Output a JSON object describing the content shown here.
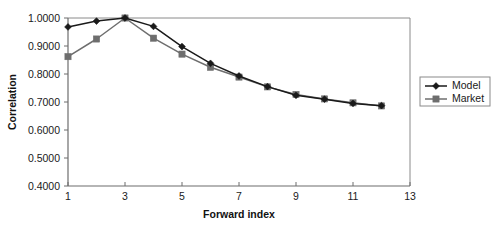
{
  "chart_data": {
    "type": "line",
    "title": "",
    "xlabel": "Forward index",
    "ylabel": "Correlation",
    "x": [
      1,
      2,
      3,
      4,
      5,
      6,
      7,
      8,
      9,
      10,
      11,
      12
    ],
    "series": [
      {
        "name": "Model",
        "marker": "diamond",
        "color": "#1a1a1a",
        "values": [
          0.968,
          0.989,
          1.0,
          0.97,
          0.898,
          0.838,
          0.793,
          0.755,
          0.724,
          0.71,
          0.695,
          0.687
        ]
      },
      {
        "name": "Market",
        "marker": "square",
        "color": "#6e6e6e",
        "values": [
          0.862,
          0.925,
          1.0,
          0.928,
          0.871,
          0.824,
          0.789,
          0.754,
          0.727,
          0.711,
          0.697,
          0.686
        ]
      }
    ],
    "xlim": [
      1,
      13
    ],
    "ylim": [
      0.4,
      1.0
    ],
    "xticks": [
      1,
      3,
      5,
      7,
      9,
      11,
      13
    ],
    "xtick_labels": [
      "1",
      "3",
      "5",
      "7",
      "9",
      "11",
      "13"
    ],
    "yticks": [
      0.4,
      0.5,
      0.6,
      0.7,
      0.8,
      0.9,
      1.0
    ],
    "ytick_labels": [
      "0.4000",
      "0.5000",
      "0.6000",
      "0.7000",
      "0.8000",
      "0.9000",
      "1.0000"
    ],
    "grid": false,
    "legend_position": "right-outside",
    "legend_entries": [
      "Model",
      "Market"
    ],
    "plot_border": [
      "left",
      "bottom",
      "top",
      "right"
    ]
  },
  "legend": {
    "items": [
      {
        "label": "Model"
      },
      {
        "label": "Market"
      }
    ]
  },
  "axes": {
    "y_title": "Correlation",
    "x_title": "Forward index"
  },
  "colors": {
    "model": "#1a1a1a",
    "market": "#6e6e6e",
    "axis": "#666666",
    "text": "#1a1a1a",
    "background": "#ffffff"
  }
}
